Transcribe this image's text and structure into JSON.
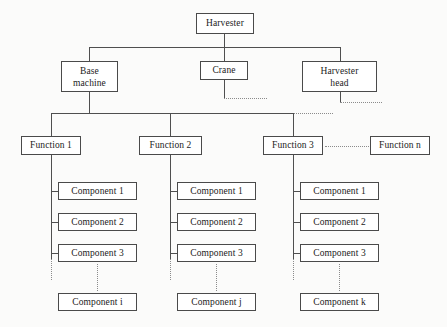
{
  "diagram": {
    "root": {
      "label": "Harvester"
    },
    "level2": [
      {
        "label_line1": "Base",
        "label_line2": "machine"
      },
      {
        "label_line1": "Crane",
        "label_line2": ""
      },
      {
        "label_line1": "Harvester",
        "label_line2": "head"
      }
    ],
    "functions": [
      {
        "label": "Function 1"
      },
      {
        "label": "Function 2"
      },
      {
        "label": "Function 3"
      },
      {
        "label": "Function n"
      }
    ],
    "component_columns": [
      {
        "parent": "Function 1",
        "items": [
          "Component 1",
          "Component 2",
          "Component 3"
        ],
        "last": "Component i"
      },
      {
        "parent": "Function 2",
        "items": [
          "Component 1",
          "Component 2",
          "Component 3"
        ],
        "last": "Component j"
      },
      {
        "parent": "Function 3",
        "items": [
          "Component 1",
          "Component 2",
          "Component 3"
        ],
        "last": "Component k"
      }
    ],
    "colors": {
      "background": "#fbfbfa",
      "box_fill": "#ffffff",
      "box_border": "#4a4a4a",
      "line": "#4f4f4f",
      "dotted_line": "#8b8b8b",
      "text": "#1b1b1b"
    }
  }
}
